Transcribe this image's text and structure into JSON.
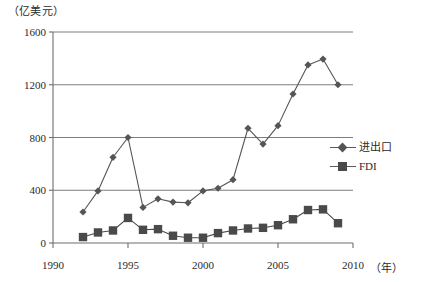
{
  "chart_data": {
    "type": "line",
    "title": "",
    "subtitle": "",
    "xlabel": "（年）",
    "ylabel": "（亿美元）",
    "x": [
      1992,
      1993,
      1994,
      1995,
      1996,
      1997,
      1998,
      1999,
      2000,
      2001,
      2002,
      2003,
      2004,
      2005,
      2006,
      2007,
      2008,
      2009
    ],
    "xlim": [
      1990,
      2010
    ],
    "ylim": [
      0,
      1600
    ],
    "xticks": [
      1990,
      1995,
      2000,
      2005,
      2010
    ],
    "yticks": [
      0,
      400,
      800,
      1200,
      1600
    ],
    "grid": true,
    "legend_position": "right",
    "series": [
      {
        "name": "进出口",
        "marker": "diamond",
        "color": "#555555",
        "values": [
          235,
          395,
          650,
          800,
          270,
          335,
          310,
          305,
          395,
          415,
          480,
          870,
          750,
          890,
          1130,
          1350,
          1395,
          1200
        ]
      },
      {
        "name": "FDI",
        "marker": "square",
        "color": "#4a4a4a",
        "values": [
          45,
          80,
          95,
          190,
          100,
          105,
          55,
          40,
          40,
          75,
          95,
          110,
          115,
          135,
          180,
          250,
          255,
          150
        ]
      }
    ]
  },
  "axes": {
    "y_unit": "（亿美元）",
    "x_unit": "（年）",
    "ytick_labels": [
      "0",
      "400",
      "800",
      "1200",
      "1600"
    ],
    "xtick_labels": [
      "1990",
      "1995",
      "2000",
      "2005",
      "2010"
    ]
  },
  "legend": {
    "items": [
      {
        "label": "进出口",
        "marker": "diamond"
      },
      {
        "label": "FDI",
        "marker": "square"
      }
    ]
  }
}
